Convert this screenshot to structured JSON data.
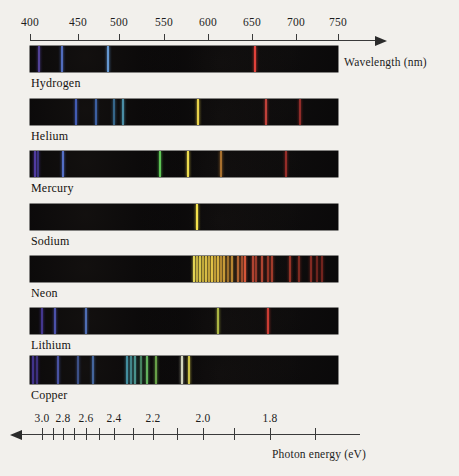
{
  "figure": {
    "kind": "emission-line-spectra",
    "background_color": "#f2f0ec",
    "band_color": "#070607"
  },
  "top_axis": {
    "title": "Wavelength (nm)",
    "unit": "nm",
    "direction": "right",
    "x_start_px": 30,
    "x_end_px": 338,
    "arrow_tip_px": 375,
    "ticks": [
      {
        "label": "400",
        "nm": 400,
        "x": 30
      },
      {
        "label": "450",
        "nm": 450,
        "x": 78
      },
      {
        "label": "500",
        "nm": 500,
        "x": 119
      },
      {
        "label": "550",
        "nm": 550,
        "x": 164
      },
      {
        "label": "600",
        "nm": 600,
        "x": 208
      },
      {
        "label": "650",
        "nm": 650,
        "x": 252
      },
      {
        "label": "700",
        "nm": 700,
        "x": 296
      },
      {
        "label": "750",
        "nm": 750,
        "x": 338
      }
    ]
  },
  "bottom_axis": {
    "title": "Photon energy (eV)",
    "unit": "eV",
    "direction": "left",
    "x_start_px": 40,
    "x_end_px": 360,
    "arrow_tip_px": 22,
    "labeled_ticks": [
      {
        "label": "3.0",
        "ev": 3.0,
        "x": 42
      },
      {
        "label": "2.8",
        "ev": 2.8,
        "x": 63
      },
      {
        "label": "2.6",
        "ev": 2.6,
        "x": 86
      },
      {
        "label": "2.4",
        "ev": 2.4,
        "x": 114
      },
      {
        "label": "2.2",
        "ev": 2.2,
        "x": 153
      },
      {
        "label": "2.0",
        "ev": 2.0,
        "x": 203
      },
      {
        "label": "1.8",
        "ev": 1.8,
        "x": 270
      }
    ],
    "minor_ticks_x": [
      42,
      53,
      63,
      74,
      86,
      99,
      114,
      133,
      153,
      177,
      203,
      234,
      270,
      315
    ]
  },
  "spectra": [
    {
      "element": "Hydrogen",
      "band": {
        "x": 30,
        "y": 46,
        "width": 308,
        "height": 26
      },
      "label_pos": {
        "x": 31,
        "y": 76
      },
      "lines": [
        {
          "nm": 410,
          "x": 39,
          "color": "#6a55c8",
          "width": 1.6,
          "intensity": 0.75
        },
        {
          "nm": 434,
          "x": 62,
          "color": "#5d7ddc",
          "width": 1.8,
          "intensity": 0.85
        },
        {
          "nm": 486,
          "x": 108,
          "color": "#6fa8e8",
          "width": 2.0,
          "intensity": 0.9
        },
        {
          "nm": 656,
          "x": 255,
          "color": "#e0413a",
          "width": 2.0,
          "intensity": 1.0
        }
      ]
    },
    {
      "element": "Helium",
      "band": {
        "x": 30,
        "y": 99,
        "width": 308,
        "height": 26
      },
      "label_pos": {
        "x": 31,
        "y": 129
      },
      "lines": [
        {
          "nm": 447,
          "x": 76,
          "color": "#4f6fdd",
          "width": 1.8,
          "intensity": 0.8
        },
        {
          "nm": 471,
          "x": 96,
          "color": "#4f82e0",
          "width": 1.6,
          "intensity": 0.7
        },
        {
          "nm": 492,
          "x": 114,
          "color": "#4fa2dd",
          "width": 1.4,
          "intensity": 0.6
        },
        {
          "nm": 502,
          "x": 123,
          "color": "#5fb8d8",
          "width": 1.6,
          "intensity": 0.75
        },
        {
          "nm": 588,
          "x": 198,
          "color": "#e9d24a",
          "width": 2.2,
          "intensity": 1.0
        },
        {
          "nm": 668,
          "x": 266,
          "color": "#df4a42",
          "width": 1.8,
          "intensity": 0.85
        },
        {
          "nm": 707,
          "x": 300,
          "color": "#c93a36",
          "width": 1.6,
          "intensity": 0.7
        }
      ]
    },
    {
      "element": "Mercury",
      "band": {
        "x": 30,
        "y": 151,
        "width": 308,
        "height": 26
      },
      "label_pos": {
        "x": 31,
        "y": 181
      },
      "lines": [
        {
          "nm": 405,
          "x": 35,
          "color": "#6146c4",
          "width": 1.8,
          "intensity": 0.8
        },
        {
          "nm": 408,
          "x": 38,
          "color": "#5a4ecb",
          "width": 1.4,
          "intensity": 0.6
        },
        {
          "nm": 436,
          "x": 63,
          "color": "#5b79da",
          "width": 2.0,
          "intensity": 0.9
        },
        {
          "nm": 546,
          "x": 160,
          "color": "#63cf5a",
          "width": 2.0,
          "intensity": 0.95
        },
        {
          "nm": 577,
          "x": 188,
          "color": "#eddb4e",
          "width": 2.2,
          "intensity": 1.0
        },
        {
          "nm": 615,
          "x": 221,
          "color": "#e89a3c",
          "width": 1.6,
          "intensity": 0.7
        },
        {
          "nm": 690,
          "x": 286,
          "color": "#cf3a34",
          "width": 1.6,
          "intensity": 0.7
        }
      ]
    },
    {
      "element": "Sodium",
      "band": {
        "x": 30,
        "y": 204,
        "width": 308,
        "height": 26
      },
      "label_pos": {
        "x": 31,
        "y": 234
      },
      "lines": [
        {
          "nm": 589,
          "x": 197,
          "color": "#f4e14c",
          "width": 2.6,
          "intensity": 1.0
        }
      ]
    },
    {
      "element": "Neon",
      "band": {
        "x": 30,
        "y": 256,
        "width": 308,
        "height": 26
      },
      "label_pos": {
        "x": 31,
        "y": 286
      },
      "lines": [
        {
          "nm": 585,
          "x": 194,
          "color": "#efe05a",
          "width": 1.6,
          "intensity": 0.95
        },
        {
          "nm": 588,
          "x": 197,
          "color": "#e9d24e",
          "width": 1.4,
          "intensity": 0.8
        },
        {
          "nm": 591,
          "x": 200,
          "color": "#edd84f",
          "width": 1.6,
          "intensity": 0.9
        },
        {
          "nm": 594,
          "x": 203,
          "color": "#e3c846",
          "width": 1.4,
          "intensity": 0.8
        },
        {
          "nm": 597,
          "x": 206,
          "color": "#eccf4c",
          "width": 1.6,
          "intensity": 0.9
        },
        {
          "nm": 600,
          "x": 209,
          "color": "#e6c244",
          "width": 1.4,
          "intensity": 0.8
        },
        {
          "nm": 603,
          "x": 212,
          "color": "#eccc4a",
          "width": 1.6,
          "intensity": 0.95
        },
        {
          "nm": 607,
          "x": 215,
          "color": "#e2b840",
          "width": 1.4,
          "intensity": 0.8
        },
        {
          "nm": 610,
          "x": 218,
          "color": "#e9c246",
          "width": 1.6,
          "intensity": 0.9
        },
        {
          "nm": 614,
          "x": 221,
          "color": "#dfa93c",
          "width": 1.4,
          "intensity": 0.75
        },
        {
          "nm": 617,
          "x": 224,
          "color": "#e6b23f",
          "width": 1.6,
          "intensity": 0.85
        },
        {
          "nm": 621,
          "x": 228,
          "color": "#db9a38",
          "width": 1.4,
          "intensity": 0.7
        },
        {
          "nm": 626,
          "x": 232,
          "color": "#e0a33a",
          "width": 1.6,
          "intensity": 0.8
        },
        {
          "nm": 633,
          "x": 238,
          "color": "#d6783a",
          "width": 1.6,
          "intensity": 0.8
        },
        {
          "nm": 638,
          "x": 242,
          "color": "#d6683a",
          "width": 1.4,
          "intensity": 0.7
        },
        {
          "nm": 640,
          "x": 245,
          "color": "#e05a3c",
          "width": 2.0,
          "intensity": 0.95
        },
        {
          "nm": 650,
          "x": 253,
          "color": "#d8523a",
          "width": 1.6,
          "intensity": 0.8
        },
        {
          "nm": 653,
          "x": 256,
          "color": "#cf4c36",
          "width": 1.4,
          "intensity": 0.7
        },
        {
          "nm": 660,
          "x": 262,
          "color": "#d6523a",
          "width": 1.6,
          "intensity": 0.8
        },
        {
          "nm": 667,
          "x": 268,
          "color": "#c8452f",
          "width": 1.4,
          "intensity": 0.7
        },
        {
          "nm": 671,
          "x": 272,
          "color": "#d04a34",
          "width": 1.6,
          "intensity": 0.75
        },
        {
          "nm": 692,
          "x": 290,
          "color": "#c34030",
          "width": 1.6,
          "intensity": 0.75
        },
        {
          "nm": 703,
          "x": 299,
          "color": "#bb3c2d",
          "width": 1.4,
          "intensity": 0.65
        },
        {
          "nm": 717,
          "x": 311,
          "color": "#b6382c",
          "width": 1.6,
          "intensity": 0.7
        },
        {
          "nm": 724,
          "x": 317,
          "color": "#ae342a",
          "width": 1.4,
          "intensity": 0.6
        },
        {
          "nm": 730,
          "x": 322,
          "color": "#a83128",
          "width": 1.6,
          "intensity": 0.65
        }
      ]
    },
    {
      "element": "Lithium",
      "band": {
        "x": 30,
        "y": 308,
        "width": 308,
        "height": 26
      },
      "label_pos": {
        "x": 31,
        "y": 338
      },
      "lines": [
        {
          "nm": 413,
          "x": 42,
          "color": "#5b49c6",
          "width": 1.6,
          "intensity": 0.7
        },
        {
          "nm": 427,
          "x": 55,
          "color": "#5a63d2",
          "width": 1.8,
          "intensity": 0.8
        },
        {
          "nm": 460,
          "x": 86,
          "color": "#5f86de",
          "width": 1.8,
          "intensity": 0.8
        },
        {
          "nm": 610,
          "x": 218,
          "color": "#c8d44e",
          "width": 1.8,
          "intensity": 0.85
        },
        {
          "nm": 670,
          "x": 268,
          "color": "#d63f36",
          "width": 2.0,
          "intensity": 0.95
        }
      ]
    },
    {
      "element": "Copper",
      "band": {
        "x": 30,
        "y": 356,
        "width": 308,
        "height": 28
      },
      "label_pos": {
        "x": 31,
        "y": 388
      },
      "lines": [
        {
          "nm": 402,
          "x": 33,
          "color": "#5844c2",
          "width": 1.6,
          "intensity": 0.7
        },
        {
          "nm": 406,
          "x": 37,
          "color": "#5d4ac8",
          "width": 1.4,
          "intensity": 0.6
        },
        {
          "nm": 427,
          "x": 58,
          "color": "#5b6ad4",
          "width": 1.6,
          "intensity": 0.75
        },
        {
          "nm": 448,
          "x": 78,
          "color": "#5a7cd8",
          "width": 1.4,
          "intensity": 0.6
        },
        {
          "nm": 465,
          "x": 93,
          "color": "#5a8ad9",
          "width": 1.6,
          "intensity": 0.7
        },
        {
          "nm": 507,
          "x": 127,
          "color": "#55b8cf",
          "width": 1.6,
          "intensity": 0.75
        },
        {
          "nm": 511,
          "x": 131,
          "color": "#5ec4cb",
          "width": 1.4,
          "intensity": 0.65
        },
        {
          "nm": 515,
          "x": 135,
          "color": "#63cbc3",
          "width": 1.6,
          "intensity": 0.7
        },
        {
          "nm": 522,
          "x": 141,
          "color": "#6ccf9a",
          "width": 1.4,
          "intensity": 0.6
        },
        {
          "nm": 529,
          "x": 147,
          "color": "#72cf6c",
          "width": 1.8,
          "intensity": 0.85
        },
        {
          "nm": 540,
          "x": 156,
          "color": "#86d35c",
          "width": 1.6,
          "intensity": 0.75
        },
        {
          "nm": 570,
          "x": 182,
          "color": "#e8ead0",
          "width": 1.8,
          "intensity": 0.9
        },
        {
          "nm": 578,
          "x": 189,
          "color": "#ede252",
          "width": 1.8,
          "intensity": 0.85
        }
      ]
    }
  ]
}
